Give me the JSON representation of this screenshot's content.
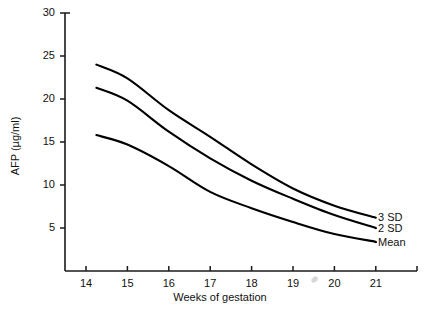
{
  "chart_data": {
    "type": "line",
    "title": "",
    "xlabel": "Weeks of gestation",
    "ylabel": "AFP (µg/ml)",
    "xlim": [
      13.4,
      21.5
    ],
    "ylim": [
      0,
      30
    ],
    "grid": false,
    "legend_position": "right-inline",
    "xticks": [
      "14",
      "15",
      "16",
      "17",
      "18",
      "19",
      "20",
      "21"
    ],
    "xtick_values": [
      14,
      15,
      16,
      17,
      18,
      19,
      20,
      21
    ],
    "yticks": [
      "5",
      "10",
      "15",
      "20",
      "25",
      "30"
    ],
    "ytick_values": [
      5,
      10,
      15,
      20,
      25,
      30
    ],
    "x": [
      14.25,
      15,
      16,
      17,
      18,
      19,
      20,
      21
    ],
    "series": [
      {
        "name": "3 SD",
        "label": "3 SD",
        "color": "#000000",
        "values": [
          24.0,
          22.4,
          18.7,
          15.6,
          12.4,
          9.6,
          7.6,
          6.2
        ]
      },
      {
        "name": "2 SD",
        "label": "2 SD",
        "color": "#000000",
        "values": [
          21.3,
          19.8,
          16.2,
          13.1,
          10.5,
          8.4,
          6.5,
          5.0
        ]
      },
      {
        "name": "Mean",
        "label": "Mean",
        "color": "#000000",
        "values": [
          15.8,
          14.7,
          12.2,
          9.2,
          7.3,
          5.7,
          4.3,
          3.4
        ]
      }
    ]
  },
  "axes": {
    "y_title": "AFP (µg/ml)",
    "x_title": "Weeks of gestation"
  },
  "labels": {
    "sd3": "3 SD",
    "sd2": "2 SD",
    "mean": "Mean"
  },
  "colors": {
    "line": "#000000",
    "axis": "#1a1a1a",
    "background": "#ffffff"
  }
}
